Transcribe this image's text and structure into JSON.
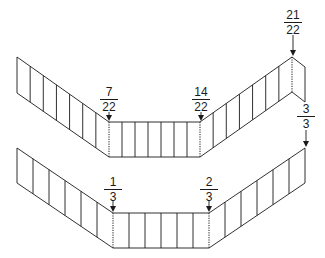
{
  "colors": {
    "stroke": "#1a1a1a",
    "background": "#ffffff"
  },
  "top_strip": {
    "panels_per_segment": 7,
    "points_top": [
      [
        17,
        57
      ],
      [
        109,
        122
      ],
      [
        200,
        122
      ],
      [
        292,
        57
      ],
      [
        305,
        67
      ]
    ],
    "points_bottom": [
      [
        17,
        93
      ],
      [
        109,
        157
      ],
      [
        200,
        157
      ],
      [
        292,
        92
      ],
      [
        305,
        102
      ]
    ],
    "folds": [
      {
        "num": "7",
        "den": "22",
        "x": 109,
        "label_y": 86,
        "arrow_top": 112,
        "arrow_tip": 121
      },
      {
        "num": "14",
        "den": "22",
        "x": 201,
        "label_y": 86,
        "arrow_top": 112,
        "arrow_tip": 121
      },
      {
        "num": "21",
        "den": "22",
        "x": 293,
        "label_y": 9,
        "arrow_top": 35,
        "arrow_tip": 56
      }
    ]
  },
  "bottom_strip": {
    "panels_per_segment": 6,
    "points_top": [
      [
        17,
        148
      ],
      [
        113,
        213
      ],
      [
        209,
        213
      ],
      [
        305,
        148
      ]
    ],
    "points_bottom": [
      [
        17,
        183
      ],
      [
        113,
        248
      ],
      [
        209,
        248
      ],
      [
        305,
        183
      ]
    ],
    "folds": [
      {
        "num": "1",
        "den": "3",
        "x": 113,
        "label_y": 176,
        "arrow_top": 201,
        "arrow_tip": 212
      },
      {
        "num": "2",
        "den": "3",
        "x": 209,
        "label_y": 176,
        "arrow_top": 201,
        "arrow_tip": 212
      }
    ],
    "end_label": {
      "num": "3",
      "den": "3",
      "x": 306,
      "label_y": 103,
      "arrow_top": 130,
      "arrow_tip": 147
    }
  }
}
